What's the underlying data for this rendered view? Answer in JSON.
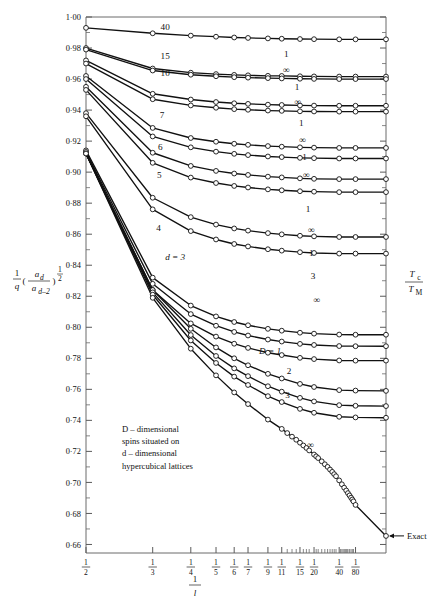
{
  "chart_data": {
    "type": "line",
    "title": "",
    "xlabel": "1/l",
    "ylabel": "(1/q)(a_d/a_{d-2})^{1/2}",
    "ylabel_right": "T_c/T_M",
    "ylim": [
      0.655,
      1.0
    ],
    "xlim": [
      0.5,
      0.0
    ],
    "grid": false,
    "legend": "inline-curve-labels",
    "annotation": "D-dimensional spins situated on d-dimensional hypercubical lattices",
    "annotation_lines": [
      "D – dimensional",
      "spins situated on",
      "d – dimensional",
      "hypercubical lattices"
    ],
    "exact_marker_label": "Exact",
    "yticks_major": [
      "1·00",
      "0·98",
      "0·96",
      "0·94",
      "0·92",
      "0·90",
      "0·88",
      "0·86",
      "0·84",
      "0·82",
      "0·80",
      "0·78",
      "0·76",
      "0·74",
      "0·72",
      "0·70",
      "0·68",
      "0·66"
    ],
    "yticks_major_values": [
      1.0,
      0.98,
      0.96,
      0.94,
      0.92,
      0.9,
      0.88,
      0.86,
      0.84,
      0.82,
      0.8,
      0.78,
      0.76,
      0.74,
      0.72,
      0.7,
      0.68,
      0.66
    ],
    "xticks": [
      {
        "num": "1",
        "den": "2",
        "value": 0.5
      },
      {
        "num": "1",
        "den": "3",
        "value": 0.3333
      },
      {
        "num": "1",
        "den": "4",
        "value": 0.25
      },
      {
        "num": "1",
        "den": "5",
        "value": 0.2
      },
      {
        "num": "1",
        "den": "6",
        "value": 0.16667
      },
      {
        "num": "1",
        "den": "7",
        "value": 0.142857
      },
      {
        "num": "1",
        "den": "9",
        "value": 0.11111
      },
      {
        "num": "1",
        "den": "11",
        "value": 0.090909
      },
      {
        "num": "1",
        "den": "15",
        "value": 0.066667
      },
      {
        "num": "1",
        "den": "20",
        "value": 0.05
      },
      {
        "num": "1",
        "den": "40",
        "value": 0.025
      },
      {
        "num": "1",
        "den": "80",
        "value": 0.0125
      }
    ],
    "xticks_minor_values": [
      0.08333,
      0.07692,
      0.07143,
      0.0625,
      0.058824,
      0.055556,
      0.047619,
      0.045455,
      0.041667,
      0.038462,
      0.035714,
      0.033333,
      0.03125,
      0.029412,
      0.027778,
      0.02381,
      0.022727,
      0.021739,
      0.020833,
      0.02,
      0.019231,
      0.018519,
      0.017857,
      0.016667,
      0.015625,
      0.014706,
      0.013889
    ],
    "curve_labels": [
      {
        "text": "40",
        "x": 0.305,
        "y": 0.9915
      },
      {
        "text": "15",
        "x": 0.305,
        "y": 0.973
      },
      {
        "text": "10",
        "x": 0.305,
        "y": 0.962
      },
      {
        "text": "7",
        "x": 0.312,
        "y": 0.935
      },
      {
        "text": "6",
        "x": 0.316,
        "y": 0.914
      },
      {
        "text": "5",
        "x": 0.318,
        "y": 0.896
      },
      {
        "text": "4",
        "x": 0.32,
        "y": 0.862
      },
      {
        "text": "d = 3",
        "x": 0.305,
        "y": 0.8435
      },
      {
        "text": "D = 1",
        "x": 0.125,
        "y": 0.783
      },
      {
        "text": "2",
        "x": 0.081,
        "y": 0.77
      },
      {
        "text": "3",
        "x": 0.083,
        "y": 0.7545
      },
      {
        "text": "1",
        "x": 0.0845,
        "y": 0.9745
      },
      {
        "text": "∞",
        "x": 0.0845,
        "y": 0.964
      },
      {
        "text": "1",
        "x": 0.0705,
        "y": 0.953
      },
      {
        "text": "∞",
        "x": 0.0695,
        "y": 0.943
      },
      {
        "text": "1",
        "x": 0.065,
        "y": 0.93
      },
      {
        "text": "∞",
        "x": 0.0635,
        "y": 0.919
      },
      {
        "text": "1",
        "x": 0.061,
        "y": 0.908
      },
      {
        "text": "∞",
        "x": 0.059,
        "y": 0.896
      },
      {
        "text": "1",
        "x": 0.057,
        "y": 0.8745
      },
      {
        "text": "∞",
        "x": 0.053,
        "y": 0.861
      },
      {
        "text": "1",
        "x": 0.053,
        "y": 0.846
      },
      {
        "text": "3",
        "x": 0.051,
        "y": 0.831
      },
      {
        "text": "∞",
        "x": 0.047,
        "y": 0.8155
      },
      {
        "text": "∞",
        "x": 0.054,
        "y": 0.7225
      }
    ],
    "series": [
      {
        "name": "d=40",
        "label": "40",
        "x": [
          0.5,
          0.3333,
          0.25,
          0.2,
          0.16667,
          0.142857,
          0.11111,
          0.090909,
          0.066667,
          0.05,
          0.025,
          0.0125,
          0.0
        ],
        "y": [
          0.993,
          0.9895,
          0.988,
          0.9873,
          0.9868,
          0.9865,
          0.9862,
          0.986,
          0.9858,
          0.9857,
          0.9856,
          0.9856,
          0.9856
        ]
      },
      {
        "name": "d=15 D=1",
        "label": "15",
        "x": [
          0.5,
          0.3333,
          0.25,
          0.2,
          0.16667,
          0.142857,
          0.11111,
          0.090909,
          0.066667,
          0.05,
          0.025,
          0.0125,
          0.0
        ],
        "y": [
          0.98,
          0.9668,
          0.9641,
          0.9632,
          0.9627,
          0.9624,
          0.9621,
          0.962,
          0.9618,
          0.9617,
          0.9616,
          0.9616,
          0.9616
        ]
      },
      {
        "name": "d=15 D=inf",
        "label": "15",
        "x": [
          0.5,
          0.3333,
          0.25,
          0.2,
          0.16667,
          0.142857,
          0.11111,
          0.090909,
          0.066667,
          0.05,
          0.025,
          0.0125,
          0.0
        ],
        "y": [
          0.979,
          0.9655,
          0.9628,
          0.9618,
          0.9612,
          0.9609,
          0.9606,
          0.9604,
          0.9602,
          0.9601,
          0.96,
          0.96,
          0.96
        ]
      },
      {
        "name": "d=10 D=1",
        "label": "10",
        "x": [
          0.5,
          0.3333,
          0.25,
          0.2,
          0.16667,
          0.142857,
          0.11111,
          0.090909,
          0.066667,
          0.05,
          0.025,
          0.0125,
          0.0
        ],
        "y": [
          0.972,
          0.9505,
          0.9468,
          0.9452,
          0.9444,
          0.944,
          0.9435,
          0.9433,
          0.943,
          0.9429,
          0.9428,
          0.9428,
          0.9428
        ]
      },
      {
        "name": "d=10 D=inf",
        "label": "10",
        "x": [
          0.5,
          0.3333,
          0.25,
          0.2,
          0.16667,
          0.142857,
          0.11111,
          0.090909,
          0.066667,
          0.05,
          0.025,
          0.0125,
          0.0
        ],
        "y": [
          0.97,
          0.947,
          0.943,
          0.9415,
          0.9406,
          0.9402,
          0.9397,
          0.9395,
          0.9392,
          0.9391,
          0.939,
          0.939,
          0.939
        ]
      },
      {
        "name": "d=7 D=1",
        "label": "7",
        "x": [
          0.5,
          0.3333,
          0.25,
          0.2,
          0.16667,
          0.142857,
          0.11111,
          0.090909,
          0.066667,
          0.05,
          0.025,
          0.0125,
          0.0
        ],
        "y": [
          0.962,
          0.9285,
          0.922,
          0.9196,
          0.9183,
          0.9176,
          0.9168,
          0.9164,
          0.916,
          0.9158,
          0.9156,
          0.9156,
          0.9156
        ]
      },
      {
        "name": "d=7 D=inf",
        "label": "7",
        "x": [
          0.5,
          0.3333,
          0.25,
          0.2,
          0.16667,
          0.142857,
          0.11111,
          0.090909,
          0.066667,
          0.05,
          0.025,
          0.0125,
          0.0
        ],
        "y": [
          0.96,
          0.923,
          0.916,
          0.9132,
          0.9118,
          0.911,
          0.9101,
          0.9097,
          0.9092,
          0.909,
          0.9088,
          0.9088,
          0.9088
        ]
      },
      {
        "name": "d=6 D=1",
        "label": "6",
        "x": [
          0.5,
          0.3333,
          0.25,
          0.2,
          0.16667,
          0.142857,
          0.11111,
          0.090909,
          0.066667,
          0.05,
          0.025,
          0.0125,
          0.0
        ],
        "y": [
          0.955,
          0.9125,
          0.904,
          0.9008,
          0.8991,
          0.8982,
          0.8971,
          0.8966,
          0.896,
          0.8957,
          0.8955,
          0.8955,
          0.8955
        ]
      },
      {
        "name": "d=6 D=inf",
        "label": "6",
        "x": [
          0.5,
          0.3333,
          0.25,
          0.2,
          0.16667,
          0.142857,
          0.11111,
          0.090909,
          0.066667,
          0.05,
          0.025,
          0.0125,
          0.0
        ],
        "y": [
          0.953,
          0.906,
          0.8965,
          0.893,
          0.8911,
          0.8901,
          0.8889,
          0.8883,
          0.8877,
          0.8874,
          0.8871,
          0.8871,
          0.8871
        ]
      },
      {
        "name": "d=5 D=1",
        "label": "5",
        "x": [
          0.5,
          0.3333,
          0.25,
          0.2,
          0.16667,
          0.142857,
          0.11111,
          0.090909,
          0.066667,
          0.05,
          0.025,
          0.0125,
          0.0
        ],
        "y": [
          0.938,
          0.8835,
          0.871,
          0.8662,
          0.8637,
          0.8623,
          0.8607,
          0.8599,
          0.859,
          0.8586,
          0.8582,
          0.8582,
          0.8582
        ]
      },
      {
        "name": "d=5 D=inf",
        "label": "5",
        "x": [
          0.5,
          0.3333,
          0.25,
          0.2,
          0.16667,
          0.142857,
          0.11111,
          0.090909,
          0.066667,
          0.05,
          0.025,
          0.0125,
          0.0
        ],
        "y": [
          0.936,
          0.876,
          0.862,
          0.8566,
          0.8537,
          0.8521,
          0.8503,
          0.8494,
          0.8484,
          0.8479,
          0.8475,
          0.8475,
          0.8475
        ]
      },
      {
        "name": "d=4 D=1",
        "label": "4",
        "x": [
          0.5,
          0.3333,
          0.25,
          0.2,
          0.16667,
          0.142857,
          0.11111,
          0.090909,
          0.066667,
          0.05,
          0.025,
          0.0125,
          0.0
        ],
        "y": [
          0.914,
          0.832,
          0.814,
          0.807,
          0.8034,
          0.8013,
          0.799,
          0.7978,
          0.7965,
          0.7959,
          0.7953,
          0.7952,
          0.7952
        ]
      },
      {
        "name": "d=4 D=3",
        "label": "4",
        "x": [
          0.5,
          0.3333,
          0.25,
          0.2,
          0.16667,
          0.142857,
          0.11111,
          0.090909,
          0.066667,
          0.05,
          0.025,
          0.0125,
          0.0
        ],
        "y": [
          0.913,
          0.828,
          0.8085,
          0.801,
          0.797,
          0.7947,
          0.7921,
          0.7908,
          0.7893,
          0.7886,
          0.7879,
          0.7878,
          0.7878
        ]
      },
      {
        "name": "d=4 D=inf",
        "label": "4",
        "x": [
          0.5,
          0.3333,
          0.25,
          0.2,
          0.16667,
          0.142857,
          0.11111,
          0.090909,
          0.066667,
          0.05,
          0.025,
          0.0125,
          0.0
        ],
        "y": [
          0.912,
          0.824,
          0.8025,
          0.794,
          0.7894,
          0.7867,
          0.7836,
          0.7821,
          0.7803,
          0.7795,
          0.7786,
          0.7785,
          0.7785
        ]
      },
      {
        "name": "d=3 D=1",
        "label": "d = 3",
        "x": [
          0.5,
          0.3333,
          0.25,
          0.2,
          0.16667,
          0.142857,
          0.11111,
          0.090909,
          0.066667,
          0.05,
          0.025,
          0.0125,
          0.0
        ],
        "y": [
          0.912,
          0.824,
          0.799,
          0.787,
          0.78,
          0.7755,
          0.77,
          0.767,
          0.7635,
          0.7615,
          0.7595,
          0.7592,
          0.759
        ]
      },
      {
        "name": "d=3 D=2",
        "label": "2",
        "x": [
          0.5,
          0.3333,
          0.25,
          0.2,
          0.16667,
          0.142857,
          0.11111,
          0.090909,
          0.066667,
          0.05,
          0.025,
          0.0125,
          0.0
        ],
        "y": [
          0.912,
          0.8225,
          0.795,
          0.7815,
          0.7735,
          0.7685,
          0.762,
          0.7585,
          0.7545,
          0.7522,
          0.7498,
          0.7494,
          0.7492
        ]
      },
      {
        "name": "d=3 D=3",
        "label": "3",
        "x": [
          0.5,
          0.3333,
          0.25,
          0.2,
          0.16667,
          0.142857,
          0.11111,
          0.090909,
          0.066667,
          0.05,
          0.025,
          0.0125,
          0.0
        ],
        "y": [
          0.912,
          0.821,
          0.7915,
          0.777,
          0.7682,
          0.7628,
          0.7556,
          0.7518,
          0.7474,
          0.7449,
          0.7423,
          0.7419,
          0.7417
        ]
      },
      {
        "name": "d=3 D=inf",
        "label": "∞",
        "x": [
          0.5,
          0.3333,
          0.25,
          0.2,
          0.16667,
          0.142857,
          0.11111,
          0.090909,
          0.083333,
          0.076923,
          0.071429,
          0.066667,
          0.0625,
          0.058824,
          0.055556,
          0.05,
          0.047619,
          0.045455,
          0.041667,
          0.038462,
          0.035714,
          0.033333,
          0.03125,
          0.029412,
          0.027778,
          0.025,
          0.022727,
          0.020833,
          0.0192,
          0.0179,
          0.0167,
          0.0156,
          0.0147,
          0.0139,
          0.0125,
          0.0
        ],
        "y": [
          0.912,
          0.819,
          0.7862,
          0.769,
          0.758,
          0.7505,
          0.7405,
          0.7345,
          0.7318,
          0.7295,
          0.7275,
          0.7256,
          0.7238,
          0.7222,
          0.7206,
          0.718,
          0.7168,
          0.7157,
          0.7136,
          0.7117,
          0.71,
          0.7083,
          0.7068,
          0.7053,
          0.704,
          0.7013,
          0.6988,
          0.6966,
          0.6948,
          0.6931,
          0.6916,
          0.6902,
          0.689,
          0.6878,
          0.6855,
          0.6655
        ]
      }
    ]
  },
  "axes": {
    "y_label_parts": {
      "one": "1",
      "q": "q",
      "num": "a",
      "num_sub": "d",
      "den": "a",
      "den_sub": "d–2",
      "exp": "1/2"
    },
    "y_right_parts": {
      "num": "T",
      "num_sub": "c",
      "den": "T",
      "den_sub": "M"
    },
    "x_label_parts": {
      "num": "1",
      "den": "l"
    }
  }
}
